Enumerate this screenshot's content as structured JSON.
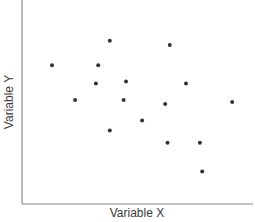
{
  "chart_data": {
    "type": "scatter",
    "title": "",
    "xlabel": "Variable X",
    "ylabel": "Variable Y",
    "xlim": [
      0,
      10
    ],
    "ylim": [
      0,
      10
    ],
    "grid": false,
    "legend": null,
    "ticks": {
      "x": [],
      "y": []
    },
    "series": [
      {
        "name": "points",
        "color": "#333333",
        "points": [
          {
            "x": 1.3,
            "y": 6.8
          },
          {
            "x": 3.8,
            "y": 8.0
          },
          {
            "x": 6.4,
            "y": 7.8
          },
          {
            "x": 3.3,
            "y": 6.8
          },
          {
            "x": 2.3,
            "y": 5.1
          },
          {
            "x": 3.2,
            "y": 5.9
          },
          {
            "x": 4.5,
            "y": 6.0
          },
          {
            "x": 7.1,
            "y": 5.9
          },
          {
            "x": 4.4,
            "y": 5.1
          },
          {
            "x": 6.2,
            "y": 4.9
          },
          {
            "x": 9.1,
            "y": 5.0
          },
          {
            "x": 5.2,
            "y": 4.1
          },
          {
            "x": 3.8,
            "y": 3.6
          },
          {
            "x": 6.3,
            "y": 3.0
          },
          {
            "x": 7.7,
            "y": 3.0
          },
          {
            "x": 7.8,
            "y": 1.6
          }
        ]
      }
    ]
  },
  "colors": {
    "axis": "#8a8a8a",
    "point": "#333333",
    "label": "#3a3a3a"
  }
}
